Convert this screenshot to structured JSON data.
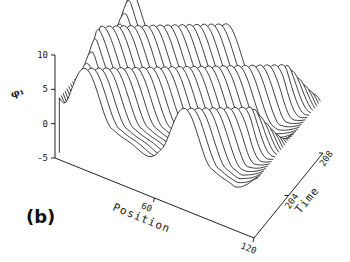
{
  "panel_label": "(b)",
  "chart_data": {
    "type": "surface-waterfall",
    "title": "",
    "zlabel": "φ₁",
    "xlabel": "Position",
    "ylabel": "Time",
    "x_range": [
      0,
      120
    ],
    "y_range": [
      200,
      208
    ],
    "z_range": [
      -5,
      10
    ],
    "z_ticks": [
      {
        "value": 10,
        "label": "10"
      },
      {
        "value": 5,
        "label": "5"
      },
      {
        "value": 0,
        "label": "0"
      },
      {
        "value": -5,
        "label": "-5"
      }
    ],
    "x_ticks": [
      {
        "value": 60,
        "label": "60"
      },
      {
        "value": 120,
        "label": "120"
      }
    ],
    "y_ticks": [
      {
        "value": 204,
        "label": "204"
      },
      {
        "value": 208,
        "label": "208"
      }
    ],
    "num_traces": 34,
    "surface": {
      "baseline": 3.0,
      "amplitude": 4.5,
      "wavenumber_cycles": 2,
      "phase_speed_cycles_per_time": 0.25,
      "line_color": "#111111"
    }
  }
}
